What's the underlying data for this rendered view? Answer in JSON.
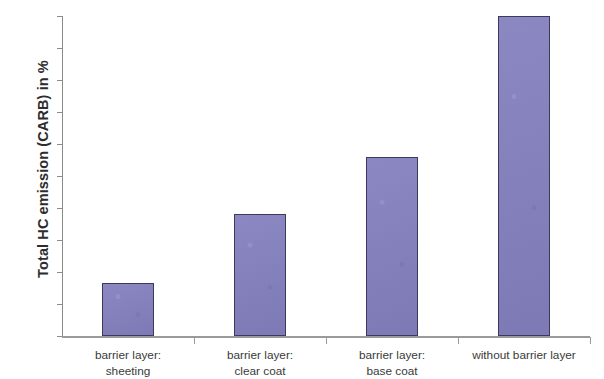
{
  "chart_data": {
    "type": "bar",
    "title": "",
    "subtitle": "",
    "xlabel": "",
    "ylabel": "Total HC emission (CARB) in %",
    "categories": [
      "barrier layer:\nsheeting",
      "barrier layer:\nclear coat",
      "barrier layer:\nbase coat",
      "without barrier layer"
    ],
    "values": [
      16.5,
      38,
      56,
      100
    ],
    "ylim": [
      0,
      100
    ],
    "y_tick_labels": [
      "100%",
      "90%",
      "80%",
      "70%",
      "60%",
      "50%",
      "40%",
      "30%",
      "20%",
      "10%",
      "0%"
    ],
    "y_tick_values": [
      100,
      90,
      80,
      70,
      60,
      50,
      40,
      30,
      20,
      10,
      0
    ],
    "grid": false,
    "legend": null,
    "legend_position": "none",
    "bar_fill_color": "#8480be",
    "bar_border_color": "#3b3a5c",
    "axis_color": "#8a8a8a",
    "background_color": "#ffffff"
  }
}
